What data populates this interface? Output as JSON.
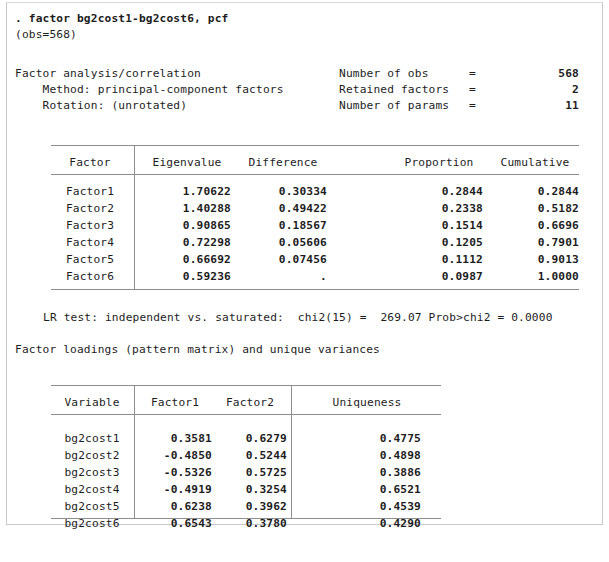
{
  "window": {
    "background_color": "#ffffff",
    "border_color": "#c9c9c9",
    "text_color": "#1d1d1d",
    "rule_color": "#8d8d8d"
  },
  "command": {
    "prompt": ".",
    "text": "factor bg2cost1-bg2cost6, pcf",
    "full_line": ". factor bg2cost1-bg2cost6, pcf"
  },
  "obs_line": "(obs=568)",
  "header": {
    "title": "Factor analysis/correlation",
    "method_label": "Method:",
    "method_value": "principal-component factors",
    "rotation_label": "Rotation:",
    "rotation_value": "(unrotated)",
    "method_line": "    Method: principal-component factors",
    "rotation_line": "    Rotation: (unrotated)",
    "stats": [
      {
        "label": "Number of obs",
        "eq": "=",
        "value": "568"
      },
      {
        "label": "Retained factors",
        "eq": "=",
        "value": "2"
      },
      {
        "label": "Number of params",
        "eq": "=",
        "value": "11"
      }
    ]
  },
  "eigen_table": {
    "columns": [
      "Factor",
      "Eigenvalue",
      "Difference",
      "Proportion",
      "Cumulative"
    ],
    "rows": [
      {
        "factor": "Factor1",
        "eigenvalue": "1.70622",
        "difference": "0.30334",
        "proportion": "0.2844",
        "cumulative": "0.2844"
      },
      {
        "factor": "Factor2",
        "eigenvalue": "1.40288",
        "difference": "0.49422",
        "proportion": "0.2338",
        "cumulative": "0.5182"
      },
      {
        "factor": "Factor3",
        "eigenvalue": "0.90865",
        "difference": "0.18567",
        "proportion": "0.1514",
        "cumulative": "0.6696"
      },
      {
        "factor": "Factor4",
        "eigenvalue": "0.72298",
        "difference": "0.05606",
        "proportion": "0.1205",
        "cumulative": "0.7901"
      },
      {
        "factor": "Factor5",
        "eigenvalue": "0.66692",
        "difference": "0.07456",
        "proportion": "0.1112",
        "cumulative": "0.9013"
      },
      {
        "factor": "Factor6",
        "eigenvalue": "0.59236",
        "difference": ".",
        "proportion": "0.0987",
        "cumulative": "1.0000"
      }
    ]
  },
  "lr_test": {
    "text": "LR test: independent vs. saturated:  chi2(15) =  269.07 Prob>chi2 = 0.0000",
    "label": "LR test: independent vs. saturated:",
    "chi2_label": "chi2(15) =",
    "chi2_value": "269.07",
    "prob_label": "Prob>chi2 =",
    "prob_value": "0.0000"
  },
  "loadings_caption": "Factor loadings (pattern matrix) and unique variances",
  "loadings_table": {
    "columns": [
      "Variable",
      "Factor1",
      "Factor2",
      "Uniqueness"
    ],
    "rows": [
      {
        "variable": "bg2cost1",
        "factor1": "0.3581",
        "factor2": "0.6279",
        "uniqueness": "0.4775"
      },
      {
        "variable": "bg2cost2",
        "factor1": "-0.4850",
        "factor2": "0.5244",
        "uniqueness": "0.4898"
      },
      {
        "variable": "bg2cost3",
        "factor1": "-0.5326",
        "factor2": "0.5725",
        "uniqueness": "0.3886"
      },
      {
        "variable": "bg2cost4",
        "factor1": "-0.4919",
        "factor2": "0.3254",
        "uniqueness": "0.6521"
      },
      {
        "variable": "bg2cost5",
        "factor1": "0.6238",
        "factor2": "0.3962",
        "uniqueness": "0.4539"
      },
      {
        "variable": "bg2cost6",
        "factor1": "0.6543",
        "factor2": "0.3780",
        "uniqueness": "0.4290"
      }
    ]
  }
}
